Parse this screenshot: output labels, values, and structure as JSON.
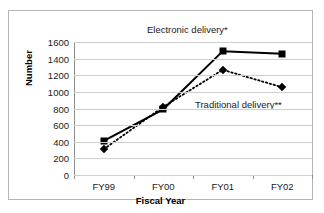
{
  "figure": {
    "clipped_header_text": "......................",
    "annotations": {
      "electronic": "Electronic delivery*",
      "traditional": "Traditional delivery**"
    }
  },
  "chart_data": {
    "type": "line",
    "title": "",
    "xlabel": "Fiscal Year",
    "ylabel": "Number",
    "categories": [
      "FY99",
      "FY00",
      "FY01",
      "FY02"
    ],
    "ylim": [
      0,
      1600
    ],
    "yticks": [
      0,
      200,
      400,
      600,
      800,
      1000,
      1200,
      1400,
      1600
    ],
    "ytick_labels": [
      "0",
      "200",
      "400",
      "600",
      "800",
      "1000",
      "1200",
      "1400",
      "1600"
    ],
    "grid": true,
    "legend_position": "inline-annotations",
    "series": [
      {
        "name": "Electronic delivery*",
        "values": [
          410,
          790,
          1490,
          1460
        ],
        "marker": "square",
        "line_style": "solid",
        "color": "#000000"
      },
      {
        "name": "Traditional delivery**",
        "values": [
          310,
          820,
          1265,
          1055
        ],
        "marker": "diamond",
        "line_style": "dotted",
        "color": "#000000"
      }
    ]
  }
}
